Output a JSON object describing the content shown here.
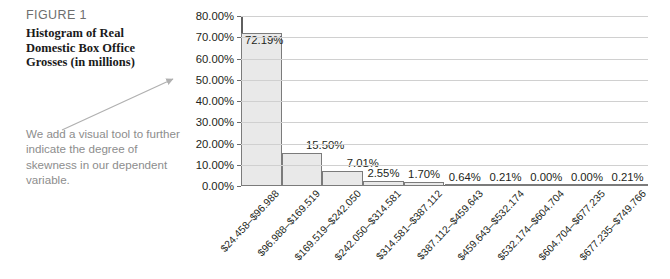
{
  "figure": {
    "label": "FIGURE 1",
    "title": "Histogram of Real Domestic Box Office Grosses (in millions)",
    "annotation": "We add a visual tool to further indicate the degree of skewness in our dependent variable.",
    "arrow_name": "skewness-pointer-arrow"
  },
  "colors": {
    "bar_fill": "#e9e9e9",
    "bar_border": "#7b7b7b",
    "gridline": "#d0d0d0",
    "axis": "#5f5f5f",
    "annotation_text": "#8d8d8d",
    "label_text": "#6e6e6e",
    "value_text": "#231f20"
  },
  "chart_data": {
    "type": "bar",
    "title": "Histogram of Real Domestic Box Office Grosses (in millions)",
    "xlabel": "",
    "ylabel": "",
    "ylim": [
      0,
      80
    ],
    "grid": true,
    "legend": "none",
    "ytick_labels": [
      "0.00%",
      "10.00%",
      "20.00%",
      "30.00%",
      "40.00%",
      "50.00%",
      "60.00%",
      "70.00%",
      "80.00%"
    ],
    "ytick_values": [
      0,
      10,
      20,
      30,
      40,
      50,
      60,
      70,
      80
    ],
    "categories": [
      "$24.458–$96.988",
      "$96.988–$169.519",
      "$169.519–$242.050",
      "$242.050–$314.581",
      "$314.581–$387.112",
      "$387.112–$459.643",
      "$459.643–$532.174",
      "$532.174–$604.704",
      "$604.704–$677.235",
      "$677.235–$749.766"
    ],
    "values": [
      72.19,
      15.5,
      7.01,
      2.55,
      1.7,
      0.64,
      0.21,
      0.0,
      0.0,
      0.21
    ],
    "value_labels": [
      "72.19%",
      "15.50%",
      "7.01%",
      "2.55%",
      "1.70%",
      "0.64%",
      "0.21%",
      "0.00%",
      "0.00%",
      "0.21%"
    ]
  }
}
